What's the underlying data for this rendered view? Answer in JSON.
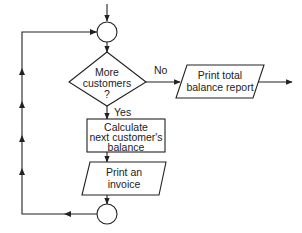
{
  "diagram": {
    "type": "flowchart",
    "colors": {
      "stroke": "#222222",
      "background": "#ffffff",
      "text": "#222222"
    },
    "nodes": {
      "start_connector": {
        "shape": "circle",
        "label": ""
      },
      "decision": {
        "shape": "diamond",
        "lines": [
          "More",
          "customers",
          "?"
        ]
      },
      "report": {
        "shape": "parallelogram",
        "lines": [
          "Print total",
          "balance report"
        ]
      },
      "calculate": {
        "shape": "rectangle",
        "lines": [
          "Calculate",
          "next customer's",
          "balance"
        ]
      },
      "invoice": {
        "shape": "parallelogram",
        "lines": [
          "Print an",
          "invoice"
        ]
      },
      "end_connector": {
        "shape": "circle",
        "label": ""
      }
    },
    "edge_labels": {
      "no": "No",
      "yes": "Yes"
    },
    "edges": [
      {
        "from": "entry",
        "to": "start_connector"
      },
      {
        "from": "start_connector",
        "to": "decision"
      },
      {
        "from": "decision",
        "to": "report",
        "label": "No"
      },
      {
        "from": "report",
        "to": "exit"
      },
      {
        "from": "decision",
        "to": "calculate",
        "label": "Yes"
      },
      {
        "from": "calculate",
        "to": "invoice"
      },
      {
        "from": "invoice",
        "to": "end_connector"
      },
      {
        "from": "end_connector",
        "to": "start_connector",
        "note": "loop back"
      }
    ]
  }
}
